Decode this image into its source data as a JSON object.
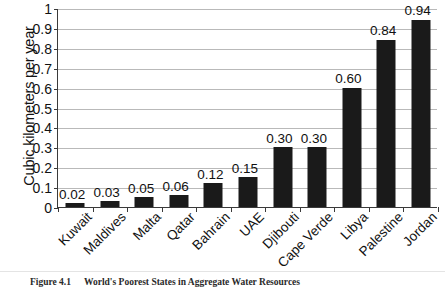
{
  "figure": {
    "caption_number": "Figure 4.1",
    "caption_text": "World's Poorest States in Aggregate Water Resources"
  },
  "chart_data": {
    "type": "bar",
    "title": "",
    "xlabel": "",
    "ylabel": "Cubic kilometers per year",
    "ylim": [
      0,
      1
    ],
    "ytick_labels": [
      "0",
      "0.1",
      "0.2",
      "0.3",
      "0.4",
      "0.5",
      "0.6",
      "0.7",
      "0.8",
      "0.9",
      "1"
    ],
    "ytick_values": [
      0,
      0.1,
      0.2,
      0.3,
      0.4,
      0.5,
      0.6,
      0.7,
      0.8,
      0.9,
      1
    ],
    "grid": true,
    "legend": "none",
    "bar_color": "#1a1a1a",
    "categories": [
      "Kuwait",
      "Maldives",
      "Malta",
      "Qatar",
      "Bahrain",
      "UAE",
      "Djibouti",
      "Cape Verde",
      "Libya",
      "Palestine",
      "Jordan"
    ],
    "values": [
      0.02,
      0.03,
      0.05,
      0.06,
      0.12,
      0.15,
      0.3,
      0.3,
      0.6,
      0.84,
      0.94
    ],
    "data_labels": [
      "0.02",
      "0.03",
      "0.05",
      "0.06",
      "0.12",
      "0.15",
      "0.30",
      "0.30",
      "0.60",
      "0.84",
      "0.94"
    ]
  }
}
